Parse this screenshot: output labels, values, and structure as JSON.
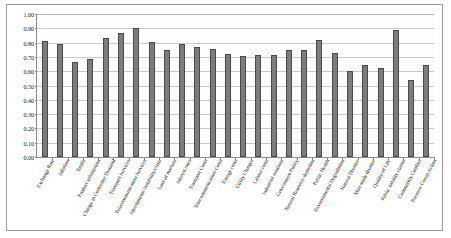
{
  "chart_data": {
    "type": "bar",
    "title": "",
    "subtitle": "",
    "xlabel": "",
    "ylabel": "",
    "ylim": [
      0.0,
      1.0
    ],
    "ytick_step": 0.1,
    "grid": true,
    "legend": false,
    "legend_position": "none",
    "bar_color": "#7d7d7d",
    "bar_edge_color": "#4a4a4a",
    "categories": [
      "Exchange Rate",
      "Inflation",
      "Tariffs",
      "Product substitution",
      "Change in Consumer Demand",
      "Transport Services",
      "Telecommunication Services",
      "International Instability/crisis",
      "Loss of markets",
      "Interest rates",
      "Transport Costs",
      "Telecommunication Costs",
      "Energy costs",
      "Utility Charges",
      "Labour costs",
      "Industrial relations",
      "Government Policy",
      "Natural Resource depletion",
      "Public Health",
      "Environmental Degradation",
      "Natural Disaster",
      "Man made disaster",
      "Quality of Life",
      "Public liability claims",
      "Community Conflict",
      "Pressure Group Action"
    ],
    "values": [
      0.81,
      0.79,
      0.665,
      0.685,
      0.83,
      0.87,
      0.905,
      0.805,
      0.75,
      0.79,
      0.77,
      0.755,
      0.72,
      0.705,
      0.715,
      0.715,
      0.745,
      0.745,
      0.815,
      0.73,
      0.6,
      0.645,
      0.625,
      0.885,
      0.54,
      0.645
    ],
    "ytick_labels": [
      "0.00",
      "0.10",
      "0.20",
      "0.30",
      "0.40",
      "0.50",
      "0.60",
      "0.70",
      "0.80",
      "0.90",
      "1.00"
    ]
  }
}
